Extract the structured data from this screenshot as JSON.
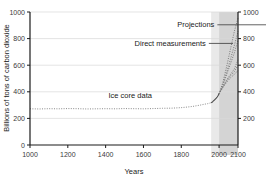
{
  "chart_data": {
    "type": "line",
    "title": "",
    "xlabel": "Years",
    "ylabel": "Billions of tons of carbon dioxide",
    "xlim": [
      1000,
      2100
    ],
    "ylim": [
      0,
      1000
    ],
    "grid": true,
    "legend_position": "inline-annotations",
    "x_ticks": [
      1000,
      1200,
      1400,
      1600,
      1800,
      2000,
      2100
    ],
    "x_tick_labels": [
      "1000",
      "1200",
      "1400",
      "1600",
      "1800",
      "2000",
      "2100"
    ],
    "y_ticks": [
      0,
      200,
      400,
      600,
      800,
      1000
    ],
    "y_tick_labels_left": [
      "0",
      "200",
      "400",
      "600",
      "800",
      "1000"
    ],
    "y_tick_labels_right": [
      "200",
      "400",
      "600",
      "800",
      "1000"
    ],
    "annotations": [
      {
        "name": "ice-core-data",
        "text": "Ice core data",
        "x": 1530,
        "y": 355
      },
      {
        "name": "direct-measurements",
        "text": "Direct measurements",
        "x": 1930,
        "y": 745
      },
      {
        "name": "projections",
        "text": "Projections",
        "x": 1975,
        "y": 885
      }
    ],
    "shaded_regions": [
      {
        "name": "direct-measurements-band",
        "x0": 1958,
        "x1": 2000,
        "color": "#e9e9e9"
      },
      {
        "name": "projections-band",
        "x0": 2000,
        "x1": 2100,
        "color": "#d4d4d4"
      }
    ],
    "series": [
      {
        "name": "Ice core data",
        "style": "dotted",
        "color": "#8a8a8a",
        "x": [
          1000,
          1050,
          1100,
          1150,
          1200,
          1250,
          1300,
          1350,
          1400,
          1450,
          1500,
          1550,
          1600,
          1650,
          1700,
          1750,
          1800,
          1830,
          1860,
          1880,
          1900,
          1920,
          1940,
          1958
        ],
        "values": [
          272,
          271,
          273,
          272,
          274,
          273,
          271,
          272,
          273,
          272,
          274,
          273,
          272,
          274,
          276,
          277,
          281,
          285,
          290,
          295,
          300,
          306,
          311,
          318
        ]
      },
      {
        "name": "Direct measurements",
        "style": "solid",
        "color": "#4a4a4a",
        "x": [
          1958,
          1965,
          1970,
          1975,
          1980,
          1985,
          1990,
          1995,
          2000
        ],
        "values": [
          318,
          324,
          331,
          338,
          345,
          352,
          361,
          372,
          385
        ]
      },
      {
        "name": "Projection A1FI (highest)",
        "style": "dotted",
        "color": "#7a7a7a",
        "x": [
          2000,
          2020,
          2040,
          2060,
          2080,
          2100
        ],
        "values": [
          385,
          470,
          590,
          720,
          850,
          955
        ]
      },
      {
        "name": "Projection A2",
        "style": "dotted",
        "color": "#7a7a7a",
        "x": [
          2000,
          2020,
          2040,
          2060,
          2080,
          2100
        ],
        "values": [
          385,
          455,
          545,
          645,
          745,
          855
        ]
      },
      {
        "name": "Projection A1B",
        "style": "dotted",
        "color": "#7a7a7a",
        "x": [
          2000,
          2020,
          2040,
          2060,
          2080,
          2100
        ],
        "values": [
          385,
          450,
          530,
          610,
          690,
          785
        ]
      },
      {
        "name": "Projection B2",
        "style": "dotted",
        "color": "#7a7a7a",
        "x": [
          2000,
          2020,
          2040,
          2060,
          2080,
          2100
        ],
        "values": [
          385,
          438,
          490,
          530,
          570,
          640
        ]
      },
      {
        "name": "Projection A1T",
        "style": "dotted",
        "color": "#7a7a7a",
        "x": [
          2000,
          2020,
          2040,
          2060,
          2080,
          2100
        ],
        "values": [
          385,
          435,
          482,
          520,
          550,
          600
        ]
      },
      {
        "name": "Projection B1 (lowest)",
        "style": "dotted",
        "color": "#7a7a7a",
        "x": [
          2000,
          2020,
          2040,
          2060,
          2080,
          2100
        ],
        "values": [
          385,
          432,
          472,
          505,
          530,
          560
        ]
      }
    ]
  },
  "colors": {
    "background": "#ffffff",
    "axis": "#1a1a1a",
    "grid": "#d8d8d8",
    "text": "#231f20",
    "data_dark": "#4a4a4a",
    "data_light": "#8a8a8a"
  }
}
